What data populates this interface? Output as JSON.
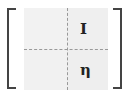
{
  "diagram": {
    "type": "block-matrix",
    "rows": 2,
    "cols": 2,
    "cells": [
      [
        "",
        "I"
      ],
      [
        "",
        "η"
      ]
    ],
    "colors": {
      "bracket": "#444444",
      "cell_fill": "#f0f0f0",
      "divider": "#999999"
    }
  }
}
